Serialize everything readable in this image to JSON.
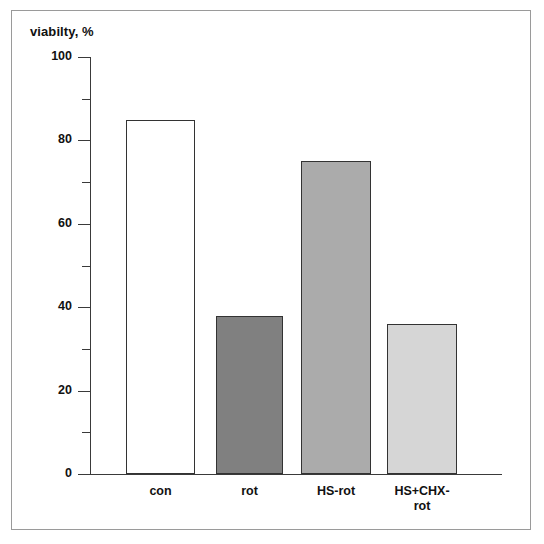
{
  "chart_data": {
    "type": "bar",
    "title": "viabilty, %",
    "xlabel": "",
    "ylabel": "",
    "ylim": [
      0,
      100
    ],
    "grid": false,
    "legend": null,
    "categories": [
      "con",
      "rot",
      "HS-rot",
      "HS+CHX-rot"
    ],
    "values": [
      85,
      38,
      75,
      36
    ],
    "ytick_labels": [
      "0",
      "20",
      "40",
      "60",
      "80",
      "100"
    ],
    "ytick_values": [
      0,
      20,
      40,
      60,
      80,
      100
    ],
    "yminor_tick_values": [
      10,
      30,
      50,
      70,
      90
    ],
    "bar_colors": [
      "#ffffff",
      "#808080",
      "#ababab",
      "#d6d6d6"
    ],
    "bar_edge_color": "#333333",
    "axis_color": "#3a3a3a",
    "frame_color": "#9a9a9a",
    "series": [
      {
        "name": "viability",
        "values": [
          85,
          38,
          75,
          36
        ]
      }
    ],
    "bars": [
      {
        "category": "con",
        "label_lines": [
          "con"
        ],
        "value": 85,
        "color": "#ffffff"
      },
      {
        "category": "rot",
        "label_lines": [
          "rot"
        ],
        "value": 38,
        "color": "#808080"
      },
      {
        "category": "HS-rot",
        "label_lines": [
          "HS-rot"
        ],
        "value": 75,
        "color": "#ababab"
      },
      {
        "category": "HS+CHX-rot",
        "label_lines": [
          "HS+CHX-",
          "rot"
        ],
        "value": 36,
        "color": "#d6d6d6"
      }
    ]
  }
}
